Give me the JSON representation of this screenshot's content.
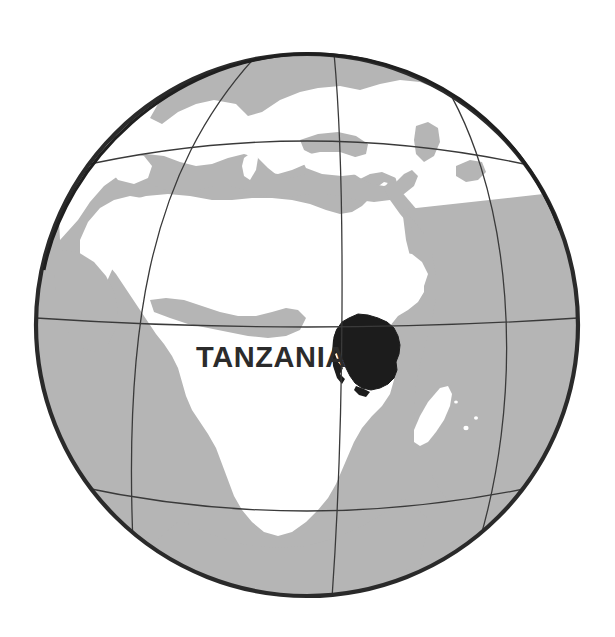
{
  "figure": {
    "kind": "locator-map",
    "projection": "orthographic-globe",
    "background_color": "#ffffff",
    "width": 615,
    "height": 637
  },
  "label": {
    "country_name": "TANZANIA",
    "text_color": "#2b2b2b"
  },
  "globe": {
    "center_x": 307,
    "center_y": 325,
    "radius": 272,
    "outline_color": "#2a2a2a",
    "outline_width": 4.5,
    "ocean_color": "#b5b5b5",
    "land_color": "#ffffff",
    "graticule_color": "#3a3a3a",
    "graticule_width": 1.3
  },
  "highlight": {
    "name": "Tanzania",
    "fill_color": "#1c1c1c",
    "bbox": [
      334,
      313,
      66,
      78
    ]
  },
  "graticule": {
    "parallels": [
      {
        "name": "tropic-of-cancer",
        "y": 147
      },
      {
        "name": "equator",
        "y": 325
      },
      {
        "name": "tropic-of-capricorn",
        "y": 492
      }
    ],
    "meridians": [
      {
        "name": "meridian-west",
        "label": "20W"
      },
      {
        "name": "meridian-center",
        "label": "20E"
      },
      {
        "name": "meridian-east",
        "label": "60E"
      }
    ]
  },
  "features": [
    {
      "name": "africa",
      "type": "continent"
    },
    {
      "name": "europe",
      "type": "continent"
    },
    {
      "name": "arabian-peninsula",
      "type": "region"
    },
    {
      "name": "madagascar",
      "type": "island"
    },
    {
      "name": "mediterranean-sea",
      "type": "sea"
    },
    {
      "name": "red-sea",
      "type": "sea"
    },
    {
      "name": "atlantic-ocean",
      "type": "ocean"
    },
    {
      "name": "indian-ocean",
      "type": "ocean"
    }
  ]
}
